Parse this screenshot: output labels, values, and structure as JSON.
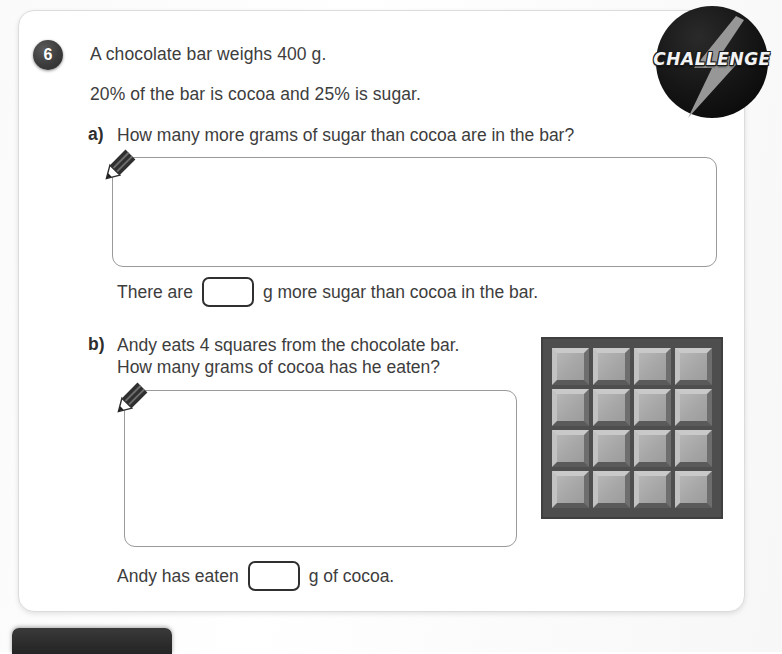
{
  "worksheet": {
    "question_number": "6",
    "stem_line_1": "A chocolate bar weighs 400 g.",
    "stem_line_2": "20% of the bar is cocoa and 25% is sugar.",
    "parts": [
      {
        "label": "a)",
        "question": "How many more grams of sugar than cocoa are in the bar?",
        "answer_sentence_prefix": "There are",
        "answer_sentence_suffix": "g more sugar than cocoa in the bar.",
        "answer_value": "",
        "working_placeholder": ""
      },
      {
        "label": "b)",
        "question": "Andy eats 4 squares from the chocolate bar.\nHow many grams of cocoa has he eaten?",
        "answer_sentence_prefix": "Andy has eaten",
        "answer_sentence_suffix": "g of cocoa.",
        "answer_value": "",
        "working_placeholder": ""
      }
    ]
  },
  "badge": {
    "label": "CHALLENGE",
    "circle_color": "#171717",
    "bolt_color": "#9e9e9e",
    "text_color": "#f2f2f2"
  },
  "chocolate_bar": {
    "rows": 4,
    "columns": 4,
    "total_squares": "16",
    "base_color": "#4e4e4e",
    "square_color": "#a8a8a8"
  },
  "icons": {
    "pencil": "pencil-icon",
    "lightning": "lightning-bolt-icon"
  },
  "colors": {
    "page_background": "#fafafa",
    "card_background": "#ffffff",
    "card_border": "#dcdcdc",
    "text": "#3d3d3d",
    "work_box_border": "#9a9a9a",
    "answer_box_border": "#303030",
    "badge_dark": "#2b2b2b"
  }
}
